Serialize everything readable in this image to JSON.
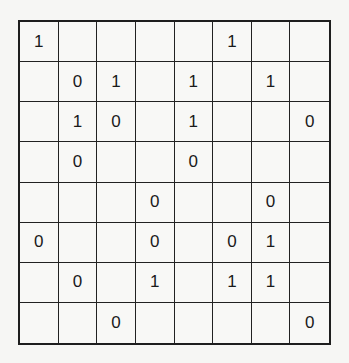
{
  "puzzle": {
    "type": "binary-takuzu",
    "size": 8,
    "grid": [
      [
        "1",
        "",
        "",
        "",
        "",
        "1",
        "",
        ""
      ],
      [
        "",
        "0",
        "1",
        "",
        "1",
        "",
        "1",
        ""
      ],
      [
        "",
        "1",
        "0",
        "",
        "1",
        "",
        "",
        "0"
      ],
      [
        "",
        "0",
        "",
        "",
        "0",
        "",
        "",
        ""
      ],
      [
        "",
        "",
        "",
        "0",
        "",
        "",
        "0",
        ""
      ],
      [
        "0",
        "",
        "",
        "0",
        "",
        "0",
        "1",
        ""
      ],
      [
        "",
        "0",
        "",
        "1",
        "",
        "1",
        "1",
        ""
      ],
      [
        "",
        "",
        "0",
        "",
        "",
        "",
        "",
        "0"
      ]
    ]
  },
  "colors": {
    "grid_line": "#1e1e1e",
    "digit": "#1a1a1a",
    "background": "#f6f6f4"
  }
}
